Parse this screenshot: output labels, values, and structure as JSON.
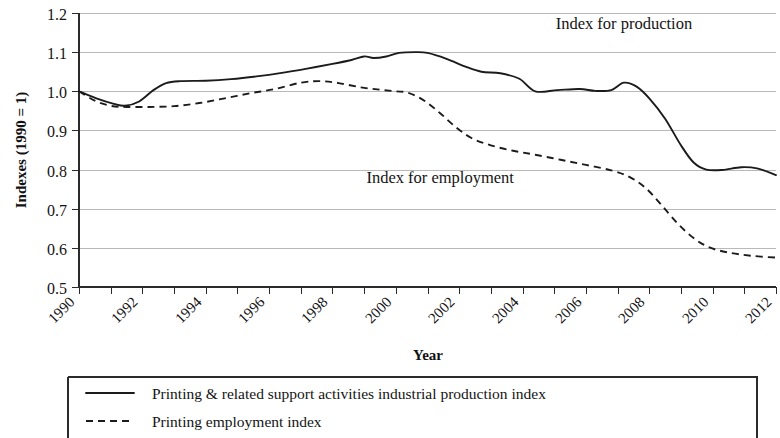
{
  "chart_data": {
    "type": "line",
    "title": "",
    "xlabel": "Year",
    "ylabel": "Indexes (1990 = 1)",
    "xlim": [
      1990,
      2012
    ],
    "ylim": [
      0.5,
      1.2
    ],
    "ytick_step": 0.1,
    "grid": true,
    "legend_position": "bottom",
    "x": [
      1990,
      1991,
      1992,
      1993,
      1994,
      1995,
      1996,
      1997,
      1998,
      1999,
      2000,
      2001,
      2002,
      2003,
      2004,
      2005,
      2006,
      2007,
      2008,
      2009,
      2010,
      2011,
      2012
    ],
    "xticks": [
      1990,
      1991,
      1992,
      1993,
      1994,
      1995,
      1996,
      1997,
      1998,
      1999,
      2000,
      2001,
      2002,
      2003,
      2004,
      2005,
      2006,
      2007,
      2008,
      2009,
      2010,
      2011,
      2012
    ],
    "xtick_labels": [
      "1990",
      "",
      "1992",
      "",
      "1994",
      "",
      "1996",
      "",
      "1998",
      "",
      "2000",
      "",
      "2002",
      "",
      "2004",
      "",
      "2006",
      "",
      "2008",
      "",
      "2010",
      "",
      "2012"
    ],
    "yticks": [
      0.5,
      0.6,
      0.7,
      0.8,
      0.9,
      1.0,
      1.1,
      1.2
    ],
    "ytick_labels": [
      "0.5",
      "0.6",
      "0.7",
      "0.8",
      "0.9",
      "1.0",
      "1.1",
      "1.2"
    ],
    "series": [
      {
        "name": "Printing & related support activities industrial production index",
        "short_name": "Index for production",
        "style": "solid",
        "color": "#1b1b1b",
        "values": [
          1.0,
          0.975,
          0.964,
          1.003,
          1.024,
          1.026,
          1.034,
          1.046,
          1.058,
          1.07,
          1.089,
          1.087,
          1.099,
          1.09,
          1.068,
          1.05,
          1.054,
          1.0,
          1.001,
          1.005,
          0.999,
          1.022,
          0.98
        ]
      },
      {
        "name": "Printing employment index",
        "short_name": "Index for employment",
        "style": "dashed",
        "color": "#1b1b1b",
        "values": [
          1.0,
          0.983,
          0.96,
          0.961,
          0.968,
          0.983,
          1.004,
          1.012,
          1.015,
          1.025,
          1.022,
          1.011,
          1.0,
          0.962,
          0.902,
          0.866,
          0.84,
          0.822,
          0.806,
          0.79,
          0.778,
          0.772,
          0.748
        ]
      }
    ],
    "series_plotted": [
      {
        "key": "production",
        "points": [
          [
            1990,
            1.0
          ],
          [
            1990.55,
            0.982
          ],
          [
            1991.1,
            0.968
          ],
          [
            1991.45,
            0.963
          ],
          [
            1991.9,
            0.974
          ],
          [
            1992.35,
            1.003
          ],
          [
            1992.75,
            1.021
          ],
          [
            1993.2,
            1.026
          ],
          [
            1994.0,
            1.027
          ],
          [
            1994.8,
            1.031
          ],
          [
            1995.6,
            1.038
          ],
          [
            1996.4,
            1.047
          ],
          [
            1997.2,
            1.058
          ],
          [
            1998.0,
            1.07
          ],
          [
            1998.6,
            1.08
          ],
          [
            1999.0,
            1.089
          ],
          [
            1999.3,
            1.085
          ],
          [
            1999.7,
            1.089
          ],
          [
            2000.1,
            1.098
          ],
          [
            2000.6,
            1.1
          ],
          [
            2001.0,
            1.098
          ],
          [
            2001.6,
            1.083
          ],
          [
            2002.2,
            1.063
          ],
          [
            2002.7,
            1.05
          ],
          [
            2003.3,
            1.046
          ],
          [
            2003.9,
            1.032
          ],
          [
            2004.4,
            1.0
          ],
          [
            2005.1,
            1.003
          ],
          [
            2005.8,
            1.006
          ],
          [
            2006.3,
            1.001
          ],
          [
            2006.8,
            1.003
          ],
          [
            2007.2,
            1.022
          ],
          [
            2007.6,
            1.012
          ],
          [
            2008.0,
            0.982
          ],
          [
            2008.5,
            0.93
          ],
          [
            2009.0,
            0.862
          ],
          [
            2009.4,
            0.818
          ],
          [
            2009.8,
            0.8
          ],
          [
            2010.3,
            0.799
          ],
          [
            2010.9,
            0.806
          ],
          [
            2011.4,
            0.803
          ],
          [
            2012.0,
            0.786
          ]
        ]
      },
      {
        "key": "employment",
        "points": [
          [
            1990,
            1.0
          ],
          [
            1990.5,
            0.976
          ],
          [
            1991.0,
            0.963
          ],
          [
            1991.5,
            0.96
          ],
          [
            1992.2,
            0.96
          ],
          [
            1993.0,
            0.962
          ],
          [
            1993.8,
            0.97
          ],
          [
            1994.6,
            0.982
          ],
          [
            1995.4,
            0.995
          ],
          [
            1996.2,
            1.006
          ],
          [
            1997.0,
            1.022
          ],
          [
            1997.6,
            1.026
          ],
          [
            1998.2,
            1.021
          ],
          [
            1998.9,
            1.01
          ],
          [
            1999.5,
            1.004
          ],
          [
            2000.0,
            1.0
          ],
          [
            2000.4,
            0.996
          ],
          [
            2000.9,
            0.976
          ],
          [
            2001.4,
            0.944
          ],
          [
            2001.9,
            0.908
          ],
          [
            2002.4,
            0.88
          ],
          [
            2003.0,
            0.862
          ],
          [
            2003.7,
            0.848
          ],
          [
            2004.4,
            0.838
          ],
          [
            2005.2,
            0.825
          ],
          [
            2006.0,
            0.812
          ],
          [
            2006.8,
            0.798
          ],
          [
            2007.4,
            0.78
          ],
          [
            2007.9,
            0.752
          ],
          [
            2008.4,
            0.708
          ],
          [
            2008.9,
            0.662
          ],
          [
            2009.4,
            0.625
          ],
          [
            2009.9,
            0.601
          ],
          [
            2010.5,
            0.588
          ],
          [
            2011.2,
            0.58
          ],
          [
            2012.0,
            0.575
          ]
        ]
      }
    ],
    "annotations": [
      {
        "text": "Index for production",
        "x": 2007.2,
        "y": 1.158
      },
      {
        "text": "Index for employment",
        "x": 2001.4,
        "y": 0.766
      }
    ]
  },
  "legend": {
    "items": [
      {
        "label": "Printing & related support activities industrial production index",
        "style": "solid"
      },
      {
        "label": "Printing employment index",
        "style": "dashed"
      }
    ]
  }
}
